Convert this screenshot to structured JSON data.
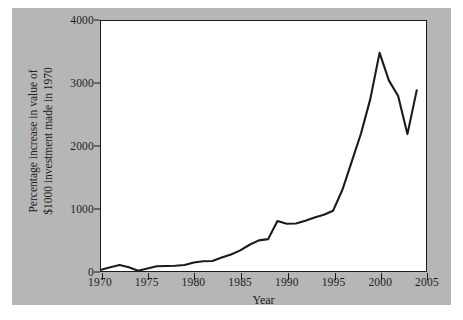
{
  "chart_data": {
    "type": "line",
    "title": "",
    "xlabel": "Year",
    "ylabel_lines": [
      "Percentage increase in value of",
      "$1000 investment made in 1970"
    ],
    "ylabel": "Percentage increase in value of $1000 investment made in 1970",
    "xlim": [
      1970,
      2005
    ],
    "ylim": [
      0,
      4000
    ],
    "xticks": [
      1970,
      1975,
      1980,
      1985,
      1990,
      1995,
      2000,
      2005
    ],
    "ytick_labels": [
      "0",
      "1000",
      "2000",
      "3000",
      "4000"
    ],
    "yticks": [
      0,
      1000,
      2000,
      3000,
      4000
    ],
    "grid": false,
    "legend": "none",
    "line_color": "#1b1b1b",
    "plot_background": "#ffffff",
    "figure_background": "#b6b6b6",
    "x": [
      1970,
      1971,
      1972,
      1973,
      1974,
      1975,
      1976,
      1977,
      1978,
      1979,
      1980,
      1981,
      1982,
      1983,
      1984,
      1985,
      1986,
      1987,
      1988,
      1989,
      1990,
      1991,
      1992,
      1993,
      1994,
      1995,
      1996,
      1997,
      1998,
      1999,
      2000,
      2001,
      2002,
      2003,
      2004
    ],
    "values": [
      20,
      60,
      95,
      60,
      5,
      40,
      75,
      80,
      85,
      95,
      135,
      155,
      160,
      215,
      265,
      330,
      420,
      490,
      510,
      800,
      755,
      760,
      805,
      855,
      900,
      965,
      1300,
      1750,
      2200,
      2750,
      3490,
      3050,
      2800,
      2190,
      2890
    ]
  }
}
